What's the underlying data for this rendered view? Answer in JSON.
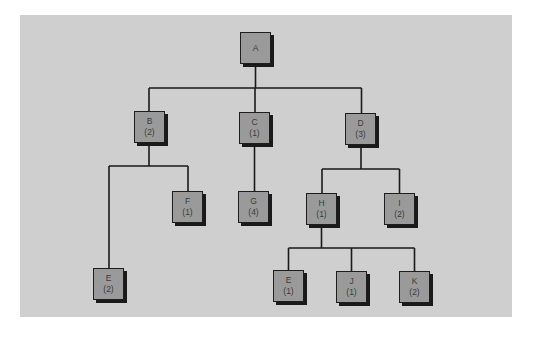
{
  "diagram": {
    "type": "tree",
    "colors": {
      "background": "#cfcfcf",
      "node_fill": "#9a9a9a",
      "node_border": "#1e1e1e",
      "link": "#1a1a1a"
    },
    "nodes": {
      "A": {
        "label": "A",
        "value": ""
      },
      "B": {
        "label": "B",
        "value": "(2)"
      },
      "C": {
        "label": "C",
        "value": "(1)"
      },
      "D": {
        "label": "D",
        "value": "(3)"
      },
      "F": {
        "label": "F",
        "value": "(1)"
      },
      "G": {
        "label": "G",
        "value": "(4)"
      },
      "H": {
        "label": "H",
        "value": "(1)"
      },
      "I": {
        "label": "I",
        "value": "(2)"
      },
      "E1": {
        "label": "E",
        "value": "(2)"
      },
      "E2": {
        "label": "E",
        "value": "(1)"
      },
      "J": {
        "label": "J",
        "value": "(1)"
      },
      "K": {
        "label": "K",
        "value": "(2)"
      }
    },
    "edges": [
      [
        "A",
        "B"
      ],
      [
        "A",
        "C"
      ],
      [
        "A",
        "D"
      ],
      [
        "B",
        "E1"
      ],
      [
        "B",
        "F"
      ],
      [
        "C",
        "G"
      ],
      [
        "D",
        "H"
      ],
      [
        "D",
        "I"
      ],
      [
        "H",
        "E2"
      ],
      [
        "H",
        "J"
      ],
      [
        "H",
        "K"
      ]
    ]
  }
}
